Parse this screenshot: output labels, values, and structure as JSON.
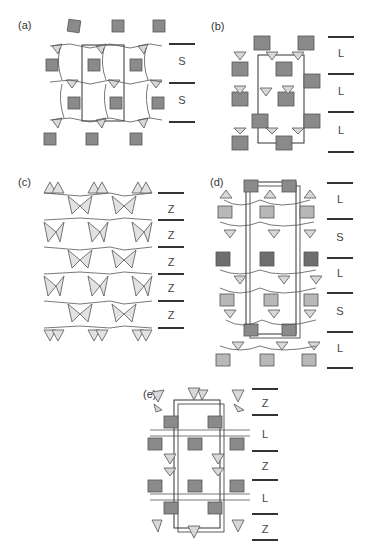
{
  "figure": {
    "panels": [
      {
        "id": "a",
        "label": "(a)",
        "stacking": [
          "S",
          "S"
        ],
        "description": "framework projection with layer sequence S S"
      },
      {
        "id": "b",
        "label": "(b)",
        "stacking": [
          "L",
          "L",
          "L"
        ],
        "description": "framework projection with layer sequence L L L"
      },
      {
        "id": "c",
        "label": "(c)",
        "stacking": [
          "Z",
          "Z",
          "Z",
          "Z",
          "Z"
        ],
        "description": "framework projection with layer sequence Z Z Z Z Z"
      },
      {
        "id": "d",
        "label": "(d)",
        "stacking": [
          "L",
          "S",
          "L",
          "S",
          "L"
        ],
        "description": "framework projection with layer sequence L S L S L"
      },
      {
        "id": "e",
        "label": "(e)",
        "stacking": [
          "Z",
          "L",
          "Z",
          "L",
          "Z"
        ],
        "description": "framework projection with layer sequence Z L Z L Z"
      }
    ],
    "colors": {
      "octahedra": "#8a8a8a",
      "tetrahedra": "#d8d8d8",
      "bonds": "#555555",
      "cell": "#333333",
      "separator": "#333333"
    }
  }
}
